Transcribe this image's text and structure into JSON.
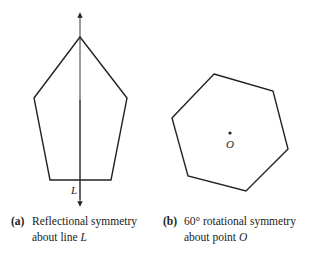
{
  "figures": [
    {
      "id": "a",
      "shape": "regular pentagon",
      "axis_label": "L",
      "caption_label": "(a)",
      "caption_line1": "Reflectional symmetry",
      "caption_line2_prefix": "about line ",
      "caption_line2_var": "L"
    },
    {
      "id": "b",
      "shape": "regular hexagon",
      "center_label": "O",
      "caption_label": "(b)",
      "caption_line1": "60° rotational symmetry",
      "caption_line2_prefix": "about point ",
      "caption_line2_var": "O"
    }
  ],
  "colors": {
    "stroke": "#222222",
    "background": "#ffffff"
  }
}
